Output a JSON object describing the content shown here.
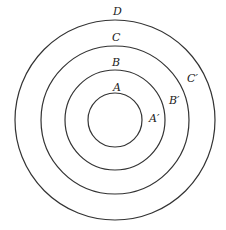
{
  "diagram": {
    "type": "concentric-circles",
    "center": {
      "x": 115,
      "y": 120
    },
    "stroke_color": "#333333",
    "circles": [
      {
        "id": "A",
        "r": 27
      },
      {
        "id": "B",
        "r": 50
      },
      {
        "id": "C",
        "r": 74
      },
      {
        "id": "D",
        "r": 100
      }
    ],
    "labels": [
      {
        "id": "D",
        "text": "D",
        "x": 113,
        "y": 15
      },
      {
        "id": "C",
        "text": "C",
        "x": 112,
        "y": 41
      },
      {
        "id": "B",
        "text": "B",
        "x": 112,
        "y": 66
      },
      {
        "id": "A",
        "text": "A",
        "x": 113,
        "y": 91
      },
      {
        "id": "C-prime",
        "text": "C′",
        "x": 187,
        "y": 82
      },
      {
        "id": "B-prime",
        "text": "B′",
        "x": 169,
        "y": 104
      },
      {
        "id": "A-prime",
        "text": "A′",
        "x": 149,
        "y": 122
      }
    ]
  }
}
